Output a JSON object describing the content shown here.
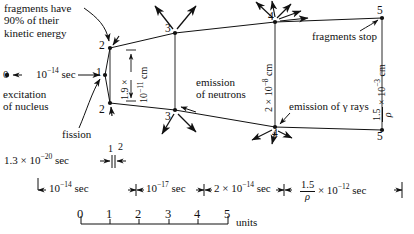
{
  "diagram": {
    "title_note": "Nuclear fission event timeline and spatial scale diagram",
    "annotations": {
      "frag_energy_l1": "fragments have",
      "frag_energy_l2": "90% of their",
      "frag_energy_l3": "kinetic energy",
      "excitation_l1": "excitation",
      "excitation_l2": "of nucleus",
      "fission": "fission",
      "emission_neutrons_l1": "emission",
      "emission_neutrons_l2": "of neutrons",
      "emission_gamma": "emission of γ rays",
      "fragments_stop": "fragments stop",
      "start_label": "0",
      "time_start": "10",
      "time_start_exp": "−14",
      "time_start_unit": "sec"
    },
    "nodes": [
      {
        "id": "1",
        "label": "1"
      },
      {
        "id": "2t",
        "label": "2"
      },
      {
        "id": "2b",
        "label": "2"
      },
      {
        "id": "3t",
        "label": "3"
      },
      {
        "id": "3b",
        "label": "3"
      },
      {
        "id": "4t",
        "label": "4"
      },
      {
        "id": "4b",
        "label": "4"
      },
      {
        "id": "5t",
        "label": "5"
      },
      {
        "id": "5b",
        "label": "5"
      }
    ],
    "distance_labels": [
      {
        "name": "dist-1-9e-11",
        "coeff": "1.9",
        "times": "×",
        "mant": "10",
        "exp": "−11",
        "unit": "cm"
      },
      {
        "name": "dist-2e-8",
        "coeff": "2",
        "times": "×",
        "mant": "10",
        "exp": "−8",
        "unit": "cm"
      },
      {
        "name": "dist-1-5-rho-e-3",
        "num": "1.5",
        "den": "ρ",
        "times": "×",
        "mant": "10",
        "exp": "−3",
        "unit": "cm"
      }
    ],
    "time_rows": {
      "row1": {
        "value_coeff": "1.3",
        "times": "×",
        "mant": "10",
        "exp": "−20",
        "unit": "sec",
        "tick_left": "1",
        "tick_right": "2"
      },
      "row2": [
        {
          "name": "interval-1-2",
          "mant": "10",
          "exp": "−14",
          "unit": "sec"
        },
        {
          "name": "interval-2-3",
          "mant": "10",
          "exp": "−17",
          "unit": "sec"
        },
        {
          "name": "interval-3-4",
          "coeff": "2",
          "times": "×",
          "mant": "10",
          "exp": "−14",
          "unit": "sec"
        },
        {
          "name": "interval-4-5",
          "num": "1.5",
          "den": "ρ",
          "times": "×",
          "mant": "10",
          "exp": "−12",
          "unit": "sec"
        }
      ]
    },
    "scale": {
      "ticks": [
        "0",
        "1",
        "2",
        "3",
        "4",
        "5"
      ],
      "unit_label": "units"
    },
    "colors": {
      "ink": "#111111",
      "background": "#ffffff"
    }
  }
}
